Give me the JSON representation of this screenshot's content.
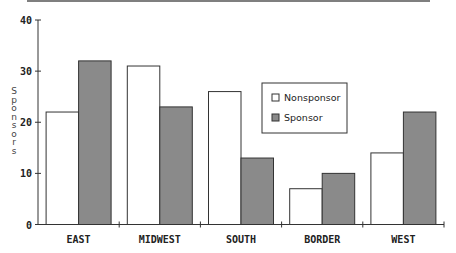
{
  "chart_data": {
    "type": "bar",
    "title": "",
    "xlabel": "",
    "ylabel": "Sponsors",
    "categories": [
      "EAST",
      "MIDWEST",
      "SOUTH",
      "BORDER",
      "WEST"
    ],
    "series": [
      {
        "name": "Nonsponsor",
        "values": [
          22,
          31,
          26,
          7,
          14
        ],
        "color": "#ffffff"
      },
      {
        "name": "Sponsor",
        "values": [
          32,
          23,
          13,
          10,
          22
        ],
        "color": "#8a8a8a"
      }
    ],
    "ylim": [
      0,
      40
    ],
    "yticks": [
      0,
      10,
      20,
      30,
      40
    ],
    "ytick_labels": [
      "0",
      "10",
      "20",
      "30",
      "40"
    ],
    "grid": false,
    "legend_position": "right-inside"
  },
  "colors": {
    "axis": "#333333",
    "bar_outline": "#333333",
    "nonsponsor_fill": "#ffffff",
    "sponsor_fill": "#8a8a8a",
    "text": "#222222"
  }
}
